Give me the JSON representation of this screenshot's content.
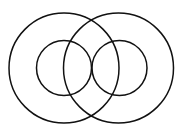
{
  "diagram": {
    "type": "concentric-overlapping-circles",
    "stroke_color": "#111111",
    "background": "#ffffff",
    "circles": [
      {
        "name": "outer-left-circle",
        "cx": 64,
        "cy": 68,
        "r": 55
      },
      {
        "name": "outer-right-circle",
        "cx": 118.5,
        "cy": 68,
        "r": 55
      },
      {
        "name": "inner-left-circle",
        "cx": 64,
        "cy": 68,
        "r": 27.5
      },
      {
        "name": "inner-right-circle",
        "cx": 119.5,
        "cy": 68,
        "r": 27.5
      }
    ]
  }
}
